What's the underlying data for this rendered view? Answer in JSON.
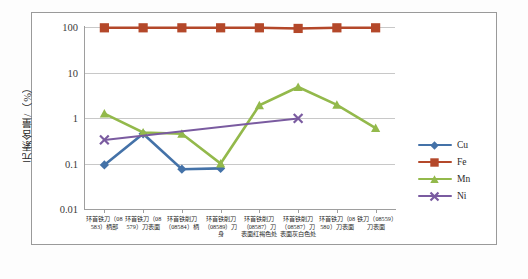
{
  "chart_data": {
    "type": "line",
    "title": "",
    "xlabel": "",
    "ylabel": "元素含量/（%）",
    "ylim": [
      0.01,
      100
    ],
    "yscale": "log",
    "grid": true,
    "legend_position": "right",
    "ytick_labels": [
      "100",
      "10",
      "1",
      "0.1",
      "0.01"
    ],
    "ytick_values": [
      100,
      10,
      1,
      0.1,
      0.01
    ],
    "categories": [
      "环首铁刀（08583）柄部",
      "环首铁刀（08579）刀表面",
      "环首铁削刀（08584）柄",
      "环首铁削刀（08589）刀身",
      "环首铁削刀（08587）刀表面红褐色处",
      "环首铁削刀（08587）刀表面灰白色处",
      "环首铁刀（08580）刀表面",
      "铁刀（08559）刀表面"
    ],
    "series": [
      {
        "name": "Cu",
        "color": "#4472a8",
        "marker": "diamond",
        "values": [
          0.093,
          0.45,
          0.075,
          0.078,
          null,
          null,
          null,
          null
        ]
      },
      {
        "name": "Fe",
        "color": "#b4482a",
        "marker": "square",
        "values": [
          96,
          96,
          96,
          96,
          96,
          93,
          96,
          96
        ]
      },
      {
        "name": "Mn",
        "color": "#93b94b",
        "marker": "triangle",
        "values": [
          1.25,
          0.48,
          0.45,
          0.1,
          1.9,
          4.8,
          1.95,
          0.6
        ]
      },
      {
        "name": "Ni",
        "color": "#7a5ba0",
        "marker": "cross",
        "values": [
          0.33,
          null,
          null,
          null,
          null,
          0.98,
          null,
          null
        ]
      }
    ]
  },
  "legend": {
    "items": [
      {
        "label": "Cu"
      },
      {
        "label": "Fe"
      },
      {
        "label": "Mn"
      },
      {
        "label": "Ni"
      }
    ]
  }
}
